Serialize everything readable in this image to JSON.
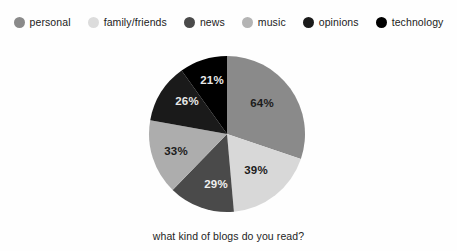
{
  "chart_data": {
    "type": "pie",
    "title": "what kind of blogs do you read?",
    "xlabel": "",
    "ylabel": "",
    "legend_position": "top",
    "note": "percentages are share of respondents (multi-select); slice angles are proportional to each value's share of the 212% total",
    "categories": [
      "personal",
      "family/friends",
      "news",
      "music",
      "opinions",
      "technology"
    ],
    "values": [
      64,
      39,
      29,
      33,
      26,
      21
    ],
    "value_labels": [
      "64%",
      "39%",
      "29%",
      "33%",
      "26%",
      "21%"
    ],
    "total": 212,
    "colors": [
      "#8a8a8a",
      "#d8d8d8",
      "#4a4a4a",
      "#adadad",
      "#1a1a1a",
      "#000000"
    ],
    "slices": [
      {
        "name": "personal",
        "value": 64,
        "label": "64%",
        "color": "#8a8a8a",
        "start_angle": 0,
        "end_angle": 108.7,
        "label_color": "#1c1c1c",
        "label_x": 262,
        "label_y": 107
      },
      {
        "name": "family/friends",
        "value": 39,
        "label": "39%",
        "color": "#d8d8d8",
        "start_angle": 108.7,
        "end_angle": 174.9,
        "label_color": "#1c1c1c",
        "label_x": 256,
        "label_y": 174
      },
      {
        "name": "news",
        "value": 29,
        "label": "29%",
        "color": "#4a4a4a",
        "start_angle": 174.9,
        "end_angle": 224.2,
        "label_color": "#f0f0f0",
        "label_x": 216,
        "label_y": 188
      },
      {
        "name": "music",
        "value": 33,
        "label": "33%",
        "color": "#adadad",
        "start_angle": 224.2,
        "end_angle": 280.2,
        "label_color": "#1c1c1c",
        "label_x": 176,
        "label_y": 155
      },
      {
        "name": "opinions",
        "value": 26,
        "label": "26%",
        "color": "#1a1a1a",
        "start_angle": 280.2,
        "end_angle": 324.4,
        "label_color": "#e8e8e8",
        "label_x": 187,
        "label_y": 105
      },
      {
        "name": "technology",
        "value": 21,
        "label": "21%",
        "color": "#000000",
        "start_angle": 324.4,
        "end_angle": 360,
        "label_color": "#e8e8e8",
        "label_x": 212,
        "label_y": 84
      }
    ],
    "geometry": {
      "cx": 227,
      "cy": 134,
      "r": 78
    }
  },
  "legend": {
    "items": [
      {
        "label": "personal",
        "color": "#8a8a8a"
      },
      {
        "label": "family/friends",
        "color": "#dcdcdc"
      },
      {
        "label": "news",
        "color": "#4a4a4a"
      },
      {
        "label": "music",
        "color": "#b4b4b4"
      },
      {
        "label": "opinions",
        "color": "#1a1a1a"
      },
      {
        "label": "technology",
        "color": "#000000"
      }
    ]
  },
  "caption": {
    "text": "what kind of blogs do you read?"
  }
}
